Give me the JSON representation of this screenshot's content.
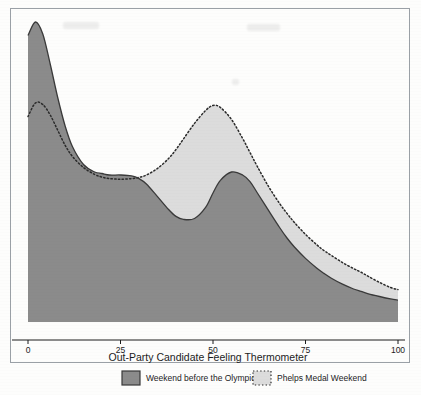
{
  "chart_data": {
    "type": "area",
    "title": "",
    "subtitle": "",
    "xlabel": "Out-Party Candidate Feeling Thermometer",
    "ylabel": "",
    "xlim": [
      0,
      100
    ],
    "ylim": [
      0,
      1
    ],
    "xticks": [
      0,
      25,
      50,
      75,
      100
    ],
    "xtick_labels": [
      "0",
      "25",
      "50",
      "75",
      "100"
    ],
    "yticks": [],
    "ytick_labels": [],
    "grid": false,
    "legend_position": "bottom",
    "x": [
      0,
      2,
      4,
      6,
      8,
      10,
      12,
      15,
      18,
      20,
      22,
      25,
      28,
      30,
      32,
      35,
      38,
      40,
      42,
      45,
      48,
      50,
      52,
      55,
      58,
      60,
      62,
      65,
      68,
      70,
      72,
      75,
      78,
      80,
      82,
      85,
      88,
      90,
      92,
      95,
      98,
      100
    ],
    "series": [
      {
        "name": "Weekend before the Olympics",
        "fill_color": "#8b8b8b",
        "line_color": "#3a3a3a",
        "line_style": "solid",
        "values": [
          0.955,
          1.0,
          0.96,
          0.86,
          0.75,
          0.655,
          0.585,
          0.525,
          0.5,
          0.495,
          0.49,
          0.49,
          0.487,
          0.478,
          0.46,
          0.418,
          0.375,
          0.352,
          0.342,
          0.345,
          0.382,
          0.43,
          0.472,
          0.5,
          0.49,
          0.468,
          0.43,
          0.372,
          0.315,
          0.28,
          0.25,
          0.212,
          0.18,
          0.162,
          0.146,
          0.126,
          0.11,
          0.102,
          0.094,
          0.085,
          0.077,
          0.073
        ]
      },
      {
        "name": "Phelps Medal Weekend",
        "fill_color": "#dcdcdc",
        "line_color": "#2a2a2a",
        "line_style": "dotted",
        "values": [
          0.685,
          0.73,
          0.725,
          0.69,
          0.64,
          0.59,
          0.552,
          0.515,
          0.492,
          0.483,
          0.478,
          0.476,
          0.478,
          0.482,
          0.49,
          0.512,
          0.545,
          0.575,
          0.61,
          0.662,
          0.705,
          0.722,
          0.715,
          0.675,
          0.612,
          0.565,
          0.518,
          0.452,
          0.395,
          0.362,
          0.332,
          0.292,
          0.258,
          0.238,
          0.222,
          0.198,
          0.178,
          0.166,
          0.152,
          0.132,
          0.115,
          0.108
        ]
      }
    ],
    "legend": [
      {
        "label": "Weekend before the Olympics",
        "swatch_fill": "#8b8b8b",
        "swatch_border": "#3a3a3a",
        "swatch_style": "solid"
      },
      {
        "label": "Phelps Medal Weekend",
        "swatch_fill": "#dcdcdc",
        "swatch_border": "#2a2a2a",
        "swatch_style": "dotted"
      }
    ],
    "colors": {
      "frame": "#9aa0a6",
      "axis": "#1c1c1c",
      "background": "#fdfdfc",
      "dark_fill": "#8b8b8b",
      "light_fill": "#dcdcdc"
    }
  }
}
